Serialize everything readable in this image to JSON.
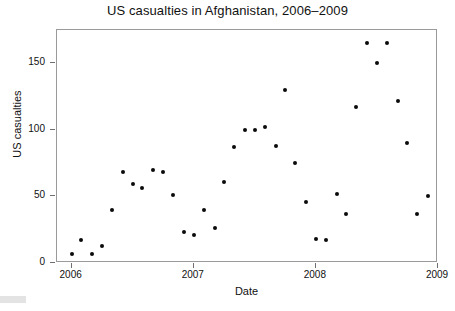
{
  "chart_data": {
    "type": "scatter",
    "title": "US casualties in Afghanistan, 2006–2009",
    "xlabel": "Date",
    "ylabel": "US casualties",
    "xlim": [
      2005.88,
      2009.0
    ],
    "ylim": [
      0,
      175
    ],
    "grid": false,
    "legend": null,
    "x_ticks": [
      {
        "value": 2006,
        "label": "2006"
      },
      {
        "value": 2007,
        "label": "2007"
      },
      {
        "value": 2008,
        "label": "2008"
      },
      {
        "value": 2009,
        "label": "2009"
      }
    ],
    "y_ticks": [
      {
        "value": 0,
        "label": "0"
      },
      {
        "value": 50,
        "label": "50"
      },
      {
        "value": 100,
        "label": "100"
      },
      {
        "value": 150,
        "label": "150"
      }
    ],
    "series": [
      {
        "name": "US casualties",
        "marker": "filled-circle",
        "color": "#0b0b0b",
        "points": [
          {
            "x": 2006.0,
            "y": 7
          },
          {
            "x": 2006.08,
            "y": 17
          },
          {
            "x": 2006.17,
            "y": 7
          },
          {
            "x": 2006.25,
            "y": 13
          },
          {
            "x": 2006.33,
            "y": 40
          },
          {
            "x": 2006.42,
            "y": 68
          },
          {
            "x": 2006.5,
            "y": 59
          },
          {
            "x": 2006.58,
            "y": 56
          },
          {
            "x": 2006.67,
            "y": 70
          },
          {
            "x": 2006.75,
            "y": 68
          },
          {
            "x": 2006.83,
            "y": 51
          },
          {
            "x": 2006.92,
            "y": 23
          },
          {
            "x": 2007.0,
            "y": 21
          },
          {
            "x": 2007.08,
            "y": 40
          },
          {
            "x": 2007.17,
            "y": 26
          },
          {
            "x": 2007.25,
            "y": 61
          },
          {
            "x": 2007.33,
            "y": 87
          },
          {
            "x": 2007.42,
            "y": 100
          },
          {
            "x": 2007.5,
            "y": 100
          },
          {
            "x": 2007.58,
            "y": 102
          },
          {
            "x": 2007.67,
            "y": 88
          },
          {
            "x": 2007.75,
            "y": 130
          },
          {
            "x": 2007.83,
            "y": 75
          },
          {
            "x": 2007.92,
            "y": 46
          },
          {
            "x": 2008.0,
            "y": 18
          },
          {
            "x": 2008.08,
            "y": 17
          },
          {
            "x": 2008.17,
            "y": 52
          },
          {
            "x": 2008.25,
            "y": 37
          },
          {
            "x": 2008.33,
            "y": 117
          },
          {
            "x": 2008.42,
            "y": 165
          },
          {
            "x": 2008.5,
            "y": 150
          },
          {
            "x": 2008.58,
            "y": 165
          },
          {
            "x": 2008.67,
            "y": 122
          },
          {
            "x": 2008.75,
            "y": 90
          },
          {
            "x": 2008.83,
            "y": 37
          },
          {
            "x": 2008.92,
            "y": 50
          }
        ]
      }
    ]
  }
}
